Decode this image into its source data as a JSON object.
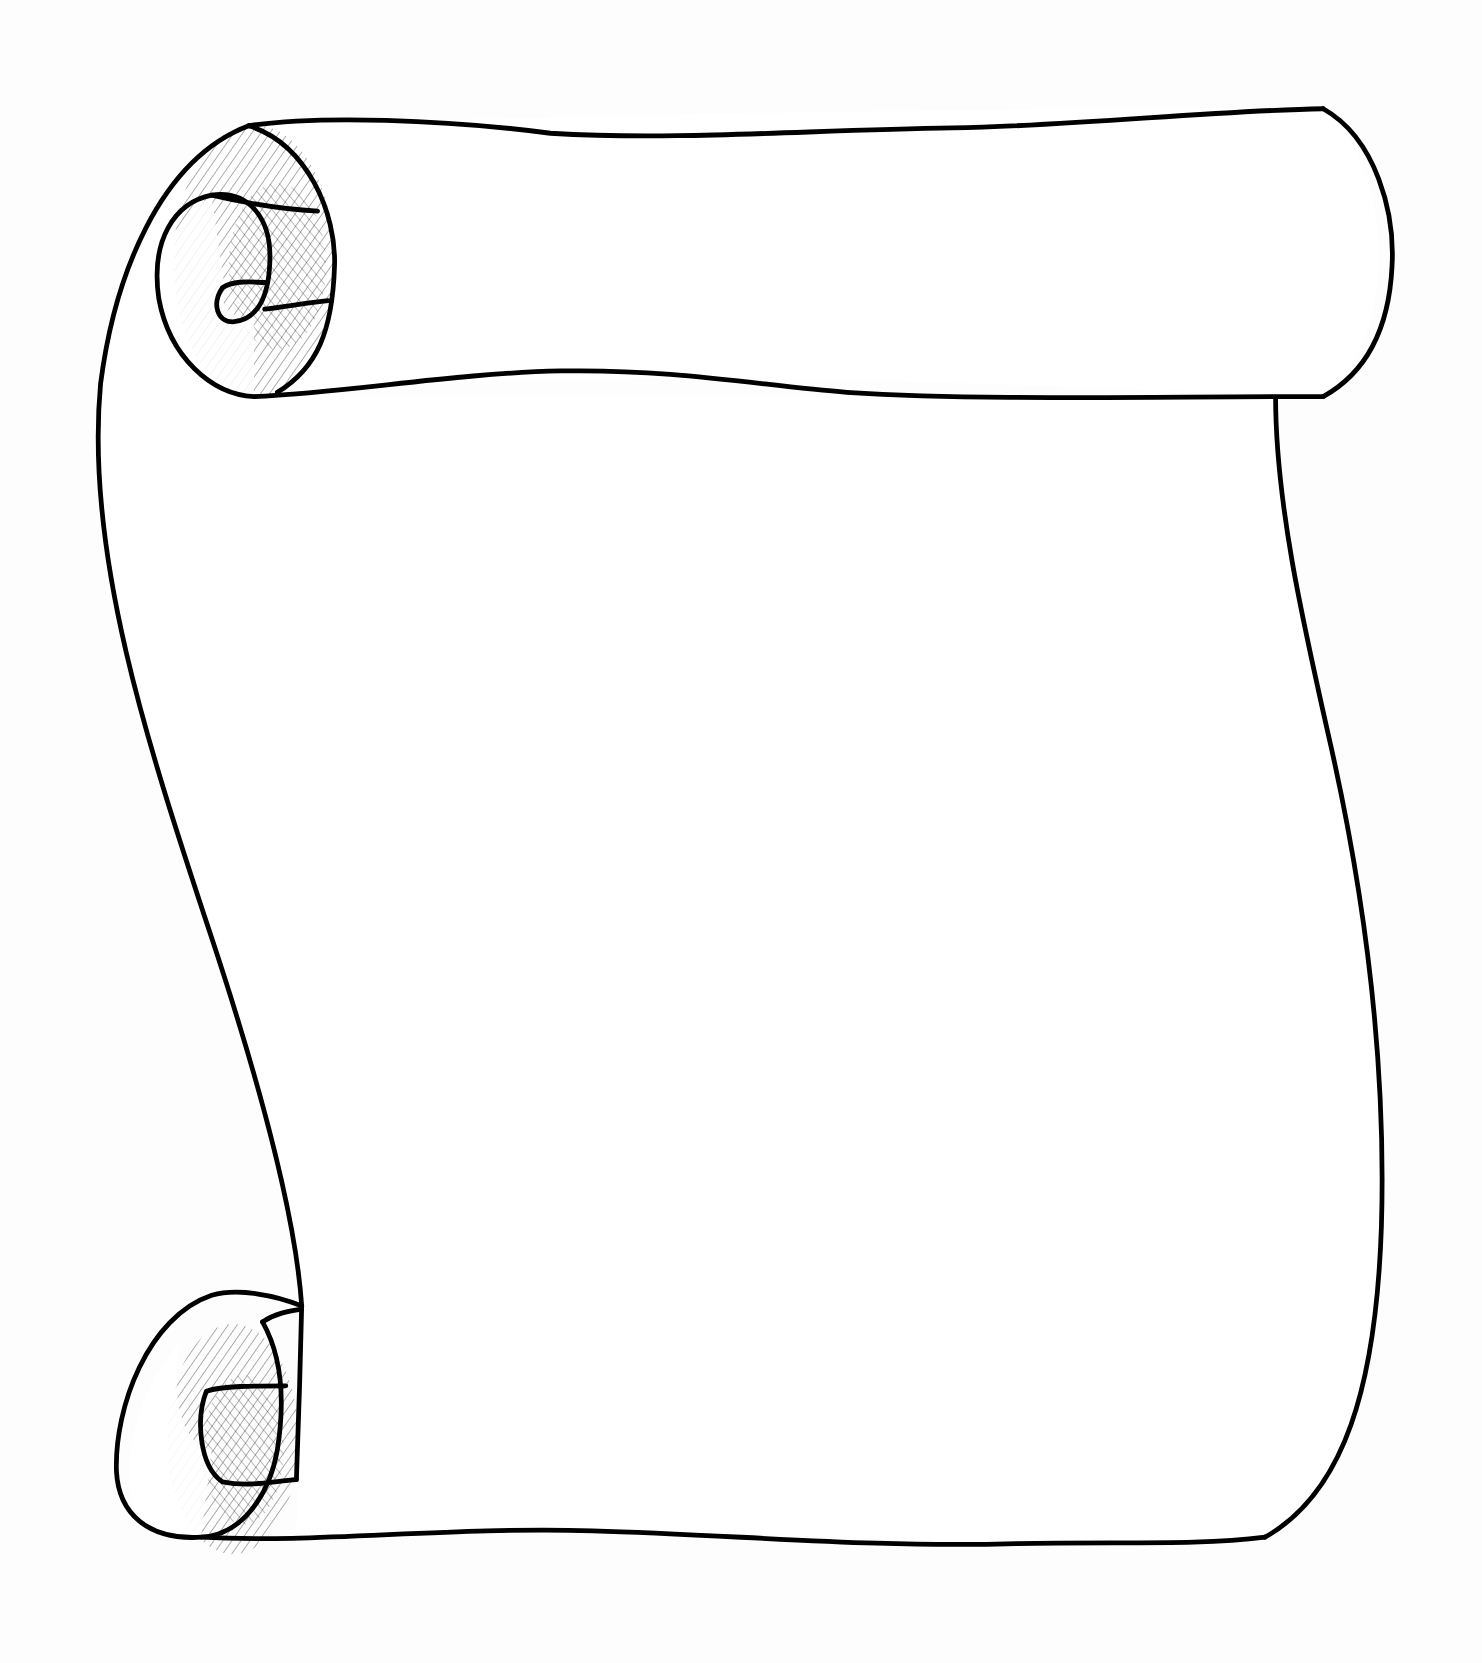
{
  "image": {
    "subject": "blank parchment scroll illustration",
    "style": "black ink line art with cross-hatched shading",
    "colors": {
      "ink": "#000000",
      "paper": "#ffffff"
    },
    "elements": [
      "top roll",
      "top-left curl",
      "scroll sheet",
      "bottom-left curl"
    ],
    "text_content": ""
  }
}
